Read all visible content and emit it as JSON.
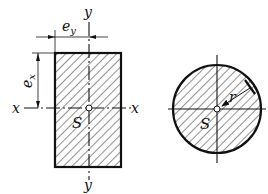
{
  "diagram": {
    "rectangle": {
      "labels": {
        "y_top": "y",
        "y_bottom": "y",
        "x_left": "x",
        "x_right": "x",
        "centroid": "S",
        "ey": "e",
        "ey_sub": "y",
        "ex": "e",
        "ex_sub": "x"
      }
    },
    "circle": {
      "labels": {
        "centroid": "S",
        "radius": "r"
      }
    },
    "colors": {
      "stroke": "#111111",
      "background": "#ffffff"
    }
  }
}
